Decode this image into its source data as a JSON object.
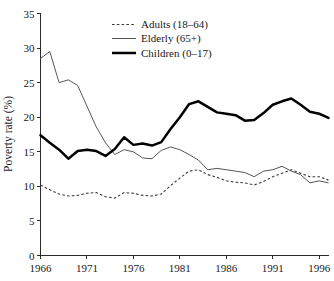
{
  "chart_data": {
    "type": "line",
    "title": "",
    "xlabel": "",
    "ylabel": "Poverty rate (%)",
    "xlim": [
      1966,
      1997
    ],
    "ylim": [
      0,
      35
    ],
    "grid": false,
    "legend_position": "top-center",
    "x_ticks": [
      1966,
      1971,
      1976,
      1981,
      1986,
      1991,
      1996
    ],
    "y_ticks": [
      0,
      5,
      10,
      15,
      20,
      25,
      30,
      35
    ],
    "x": [
      1966,
      1967,
      1968,
      1969,
      1970,
      1971,
      1972,
      1973,
      1974,
      1975,
      1976,
      1977,
      1978,
      1979,
      1980,
      1981,
      1982,
      1983,
      1984,
      1985,
      1986,
      1987,
      1988,
      1989,
      1990,
      1991,
      1992,
      1993,
      1994,
      1995,
      1996,
      1997
    ],
    "series": [
      {
        "name": "Adults (18–64)",
        "style": "dotted",
        "color": "#3a3a3a",
        "values": [
          10.2,
          9.5,
          8.9,
          8.6,
          8.7,
          9.0,
          9.1,
          8.5,
          8.3,
          9.1,
          9.0,
          8.7,
          8.6,
          8.9,
          10.1,
          11.2,
          12.2,
          12.4,
          11.7,
          11.3,
          10.8,
          10.6,
          10.5,
          10.2,
          10.7,
          11.4,
          11.9,
          12.4,
          11.9,
          11.4,
          11.4,
          10.9
        ]
      },
      {
        "name": "Elderly (65+)",
        "style": "solid-thin",
        "color": "#555555",
        "values": [
          28.5,
          29.5,
          25.0,
          25.4,
          24.6,
          21.6,
          18.6,
          16.3,
          14.6,
          15.3,
          15.0,
          14.1,
          14.0,
          15.2,
          15.7,
          15.3,
          14.6,
          13.8,
          12.4,
          12.6,
          12.4,
          12.2,
          12.0,
          11.4,
          12.2,
          12.4,
          12.9,
          12.2,
          11.7,
          10.5,
          10.8,
          10.5
        ]
      },
      {
        "name": "Children (0–17)",
        "style": "solid-thick",
        "color": "#000000",
        "values": [
          17.4,
          16.3,
          15.3,
          14.0,
          15.1,
          15.3,
          15.1,
          14.4,
          15.4,
          17.1,
          16.0,
          16.2,
          15.9,
          16.4,
          18.3,
          20.0,
          21.9,
          22.3,
          21.5,
          20.7,
          20.5,
          20.3,
          19.5,
          19.6,
          20.6,
          21.8,
          22.3,
          22.7,
          21.8,
          20.8,
          20.5,
          19.9
        ]
      }
    ]
  },
  "axis": {
    "y_title": "Poverty rate (%)",
    "y_tick_labels": [
      "0",
      "5",
      "10",
      "15",
      "20",
      "25",
      "30",
      "35"
    ],
    "x_tick_labels": [
      "1966",
      "1971",
      "1976",
      "1981",
      "1986",
      "1991",
      "1996"
    ]
  },
  "legend": {
    "entries": [
      {
        "label": "Adults (18–64)"
      },
      {
        "label": "Elderly (65+)"
      },
      {
        "label": "Children (0–17)"
      }
    ]
  }
}
